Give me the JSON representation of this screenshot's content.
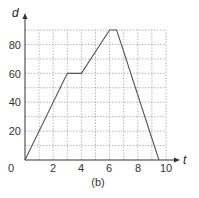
{
  "chart_data": {
    "type": "line",
    "title": "",
    "caption": "(b)",
    "xlabel": "t",
    "ylabel": "d",
    "xlim": [
      0,
      10
    ],
    "ylim": [
      0,
      90
    ],
    "grid": true,
    "x_ticks": [
      "0",
      "2",
      "4",
      "6",
      "8",
      "10"
    ],
    "y_ticks": [
      "20",
      "40",
      "60",
      "80"
    ],
    "series": [
      {
        "name": "d vs t",
        "points": [
          [
            0,
            0
          ],
          [
            3,
            60
          ],
          [
            4,
            60
          ],
          [
            6,
            90
          ],
          [
            6.5,
            90
          ],
          [
            9.5,
            0
          ]
        ]
      }
    ]
  },
  "labels": {
    "origin": "0",
    "x_axis": "t",
    "y_axis": "d",
    "caption": "(b)",
    "x2": "2",
    "x4": "4",
    "x6": "6",
    "x8": "8",
    "x10": "10",
    "y20": "20",
    "y40": "40",
    "y60": "60",
    "y80": "80"
  },
  "colors": {
    "line": "#555555",
    "grid": "#888888",
    "axis": "#333333"
  }
}
